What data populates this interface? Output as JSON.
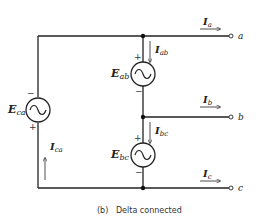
{
  "caption": "(b)   Delta connected",
  "terminals": {
    "a": "a",
    "b": "b",
    "c": "c"
  },
  "sources": {
    "ab": {
      "label": "E",
      "sub": "ab",
      "plus": "+",
      "minus": "−",
      "icon": "ac-source-icon"
    },
    "bc": {
      "label": "E",
      "sub": "bc",
      "plus": "+",
      "minus": "−",
      "icon": "ac-source-icon"
    },
    "ca": {
      "label": "E",
      "sub": "ca",
      "plus": "+",
      "minus": "−",
      "icon": "ac-source-icon"
    }
  },
  "currents": {
    "a": {
      "label": "I",
      "sub": "a"
    },
    "b": {
      "label": "I",
      "sub": "b"
    },
    "c": {
      "label": "I",
      "sub": "c"
    },
    "ab": {
      "label": "I",
      "sub": "ab"
    },
    "bc": {
      "label": "I",
      "sub": "bc"
    },
    "ca": {
      "label": "I",
      "sub": "ca"
    }
  },
  "colors": {
    "wire": "#222222",
    "background": "#ffffff"
  }
}
